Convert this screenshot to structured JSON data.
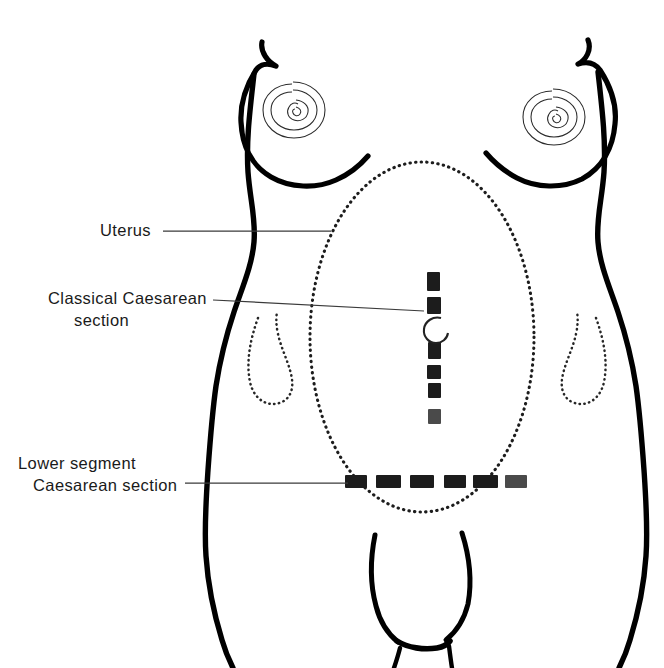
{
  "figure": {
    "title": "",
    "background_color": "#ffffff",
    "line_color": "#000000",
    "text_color": "#1a1a1a",
    "leader_color": "#3a3a3a"
  },
  "labels": [
    {
      "id": "uterus",
      "name": "uterus-label",
      "lines": [
        "Uterus"
      ],
      "text_x": 100,
      "text_y": 236,
      "align": "start",
      "leader": {
        "x1": 163,
        "y1": 231,
        "x2": 331,
        "y2": 231
      }
    },
    {
      "id": "classical-caesarean-section",
      "name": "classical-caesarean-label",
      "lines": [
        "Classical Caesarean",
        "section"
      ],
      "text_x": 48,
      "text_y": 304,
      "align": "start",
      "leader": {
        "x1": 213,
        "y1": 300,
        "x2": 424,
        "y2": 311
      }
    },
    {
      "id": "lower-segment-caesarean-section",
      "name": "lower-segment-caesarean-label",
      "lines": [
        "Lower segment",
        "Caesarean section"
      ],
      "text_x": 18,
      "text_y": 469,
      "align": "start",
      "leader": {
        "x1": 185,
        "y1": 483,
        "x2": 345,
        "y2": 483
      }
    }
  ],
  "anatomy": {
    "uterus_outline": {
      "name": "uterus-dotted-ellipse",
      "shape": "ellipse",
      "cx": 422,
      "cy": 337,
      "rx": 112,
      "ry": 175,
      "style": "dotted"
    },
    "breasts": [
      {
        "name": "left-breast",
        "nipple_cx": 293,
        "nipple_cy": 110
      },
      {
        "name": "right-breast",
        "nipple_cx": 553,
        "nipple_cy": 117
      }
    ],
    "groin_creases": [
      {
        "name": "left-groin-crease",
        "side": "left"
      },
      {
        "name": "right-groin-crease",
        "side": "right"
      }
    ]
  },
  "incisions": [
    {
      "id": "classical",
      "name": "classical-vertical-incision",
      "orientation": "vertical",
      "description": "Classical Caesarean section: vertical midline incision with sutures above and below the umbilicus.",
      "x": 434,
      "y_start": 272,
      "y_end": 424,
      "suture_count": 7
    },
    {
      "id": "lower-segment",
      "name": "lower-segment-transverse-incision",
      "orientation": "horizontal",
      "description": "Lower segment Caesarean section: transverse suprapubic incision with six suture groups.",
      "y": 482,
      "x_start": 345,
      "x_end": 527,
      "suture_count": 6
    }
  ],
  "umbilicus": {
    "name": "umbilicus",
    "cx": 434,
    "cy": 325,
    "r": 8
  }
}
